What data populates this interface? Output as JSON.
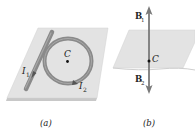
{
  "figure": {
    "panels": [
      {
        "id": "a",
        "caption": "(a)",
        "labels": {
          "center": "C",
          "current1": "I",
          "current1_sub": "1",
          "current2": "I",
          "current2_sub": "2"
        },
        "elements": [
          "plate",
          "straight-wire",
          "circular-loop",
          "center-point"
        ]
      },
      {
        "id": "b",
        "caption": "(b)",
        "labels": {
          "center": "C",
          "field1": "B",
          "field1_sub": "1",
          "field2": "B",
          "field2_sub": "2"
        },
        "elements": [
          "plate",
          "field-vector-up",
          "field-vector-down",
          "center-point"
        ]
      }
    ],
    "colors": {
      "plate_fill": "#e2e2e2",
      "plate_edge": "#c4c4c4",
      "wire": "#8a8a8a",
      "wire_dark": "#6e6e6e",
      "arrow": "#7a7a7a",
      "text": "#222222"
    }
  }
}
